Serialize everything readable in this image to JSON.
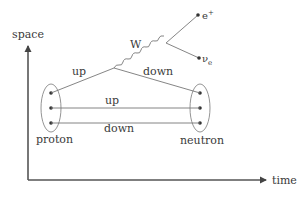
{
  "diagram": {
    "axes": {
      "vertical_label": "space",
      "horizontal_label": "time"
    },
    "particles": {
      "initial": "proton",
      "final": "neutron"
    },
    "quark_lines": [
      {
        "label": "up",
        "from": "proton",
        "to": "vertex"
      },
      {
        "label": "down",
        "from": "vertex",
        "to": "neutron"
      },
      {
        "label": "up",
        "from": "proton",
        "to": "neutron"
      },
      {
        "label": "down",
        "from": "proton",
        "to": "neutron"
      }
    ],
    "boson": {
      "label": "W"
    },
    "leptons": [
      {
        "label": "e",
        "superscript": "+"
      },
      {
        "label": "ν",
        "subscript": "e"
      }
    ],
    "colors": {
      "background": "#ffffff",
      "axis": "#555555",
      "line": "#777777",
      "dot": "#333333",
      "text": "#3a3a3a"
    }
  }
}
